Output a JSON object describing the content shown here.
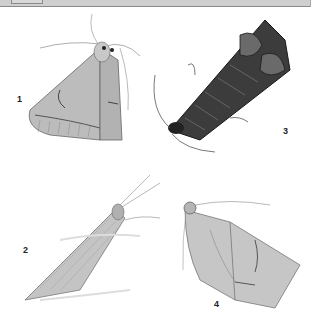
{
  "plate": {
    "labels": [
      "1",
      "2",
      "3",
      "4"
    ],
    "figures": [
      {
        "id": "1",
        "subject": "moth-1",
        "description": "triangular-winged moth, pale grey with dark wing lines"
      },
      {
        "id": "2",
        "subject": "moth-2",
        "description": "narrow elongated moth with long antennae"
      },
      {
        "id": "3",
        "subject": "moth-3",
        "description": "dark mottled moth with wing tips curled"
      },
      {
        "id": "4",
        "subject": "moth-4",
        "description": "broad pale moth with dark wing markings"
      }
    ]
  },
  "colors": {
    "header_bg": "#cfcfcf",
    "header_border": "#8a8a8a",
    "ink": "#222222"
  }
}
